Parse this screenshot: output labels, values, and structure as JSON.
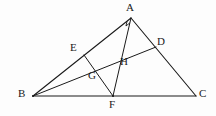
{
  "figure": {
    "background_color": "#fdfdfd",
    "stroke_color": "#1a1a1a",
    "label_color": "#1a1a1a",
    "width": 216,
    "height": 116,
    "points": {
      "A": {
        "name": "A",
        "x": 131,
        "y": 18,
        "label_x": 126,
        "label_y": 2
      },
      "B": {
        "name": "B",
        "x": 33,
        "y": 96,
        "label_x": 18,
        "label_y": 88
      },
      "C": {
        "name": "C",
        "x": 196,
        "y": 96,
        "label_x": 199,
        "label_y": 88
      },
      "D": {
        "name": "D",
        "x": 156,
        "y": 47,
        "label_x": 157,
        "label_y": 36
      },
      "E": {
        "name": "E",
        "x": 84,
        "y": 55,
        "label_x": 70,
        "label_y": 42
      },
      "F": {
        "name": "F",
        "x": 113,
        "y": 96,
        "label_x": 109,
        "label_y": 99
      },
      "G": {
        "name": "G",
        "x": 99,
        "y": 77,
        "label_x": 88,
        "label_y": 70
      },
      "H": {
        "name": "H",
        "x": 122,
        "y": 58,
        "label_x": 120,
        "label_y": 56
      }
    },
    "segments": [
      {
        "name": "side-AB",
        "from": "A",
        "to": "B",
        "width": 1.1
      },
      {
        "name": "side-AC",
        "from": "A",
        "to": "C",
        "width": 1.1
      },
      {
        "name": "side-BC",
        "from": "B",
        "to": "C",
        "width": 1.1
      },
      {
        "name": "cevian-AF",
        "from": "A",
        "to": "F",
        "width": 1.0
      },
      {
        "name": "cevian-BD",
        "from": "B",
        "to": "D",
        "width": 1.0
      },
      {
        "name": "segment-EF",
        "from": "E",
        "to": "F",
        "width": 1.0
      }
    ],
    "angle_marks": [
      {
        "name": "right-angle-at-A",
        "vertex": "A",
        "size": 5
      }
    ]
  }
}
